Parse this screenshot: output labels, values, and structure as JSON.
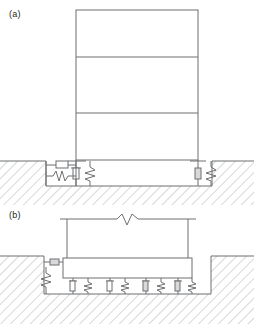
{
  "figure": {
    "type": "engineering-section-diagram",
    "panels": [
      {
        "id": "a",
        "label": "(a)",
        "description": "Three-story frame supported on vertical springs and dampers within an excavated pit, with a horizontal spring-damper restraint against the left pit wall.",
        "superstructure": {
          "name": "three-story-frame",
          "stories": 3,
          "floor_lines": 2,
          "columns": 2
        },
        "isolators": [
          {
            "id": "left-vertical",
            "type": "spring-damper-pair",
            "orientation": "vertical",
            "elements": [
              "damper",
              "spring"
            ]
          },
          {
            "id": "right-vertical",
            "type": "spring-damper-pair",
            "orientation": "vertical",
            "elements": [
              "damper",
              "spring"
            ]
          },
          {
            "id": "left-horizontal",
            "type": "spring-damper-pair",
            "orientation": "horizontal",
            "elements": [
              "damper",
              "spring"
            ]
          }
        ],
        "ground": {
          "name": "hatched-soil",
          "pit": true
        }
      },
      {
        "id": "b",
        "label": "(b)",
        "description": "Rigid base mat on four vertical spring-damper isolator pairs, with horizontal spring and damper bearing on the left pit wall; superstructure truncated with a break symbol.",
        "superstructure": {
          "name": "truncated-superstructure",
          "columns": 2,
          "break_symbol": true
        },
        "base_mat": {
          "name": "rigid-base-mat"
        },
        "isolators": [
          {
            "id": "vertical-1",
            "type": "spring-damper-pair",
            "orientation": "vertical",
            "elements": [
              "damper",
              "spring"
            ]
          },
          {
            "id": "vertical-2",
            "type": "spring-damper-pair",
            "orientation": "vertical",
            "elements": [
              "damper",
              "spring"
            ]
          },
          {
            "id": "vertical-3",
            "type": "spring-damper-pair",
            "orientation": "vertical",
            "elements": [
              "damper",
              "spring"
            ]
          },
          {
            "id": "vertical-4",
            "type": "spring-damper-pair",
            "orientation": "vertical",
            "elements": [
              "damper",
              "spring"
            ]
          },
          {
            "id": "left-horizontal",
            "type": "spring-damper-pair",
            "orientation": "horizontal",
            "elements": [
              "damper",
              "spring"
            ]
          }
        ],
        "ground": {
          "name": "hatched-soil",
          "pit": true
        }
      }
    ]
  },
  "colors": {
    "line": "#6d6e71",
    "line_dark": "#58595b",
    "hatch": "#a7a9ac",
    "text": "#231f20",
    "background": "#ffffff"
  }
}
